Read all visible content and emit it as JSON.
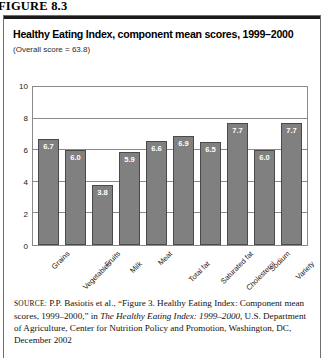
{
  "figure_label": "FIGURE 8.3",
  "chart_data": {
    "type": "bar",
    "title": "Healthy Eating Index, component mean scores, 1999–2000",
    "subtitle": "(Overall score = 63.8)",
    "xlabel": "",
    "ylabel": "",
    "ylim": [
      0,
      10
    ],
    "yticks": [
      10,
      8,
      6,
      4,
      2,
      0
    ],
    "grid": true,
    "legend": false,
    "bar_color": "#808080",
    "bar_edge_color": "#4a4a4a",
    "value_label_color": "#ffffff",
    "categories": [
      "Grains",
      "Vegetables",
      "Fruits",
      "Milk",
      "Meat",
      "Total fat",
      "Saturated fat",
      "Cholesterol",
      "Sodium",
      "Variety"
    ],
    "values": [
      6.7,
      6.0,
      3.8,
      5.9,
      6.6,
      6.9,
      6.5,
      7.7,
      6.0,
      7.7
    ],
    "value_labels": [
      "6.7",
      "6.0",
      "3.8",
      "5.9",
      "6.6",
      "6.9",
      "6.5",
      "7.7",
      "6.0",
      "7.7"
    ]
  },
  "source": {
    "kicker": "source:",
    "text_before_italic": " P.P. Basiotis et al., “Figure 3. Healthy Eating Index: Component mean scores, 1999–2000,” in ",
    "italic_title": "The Healthy Eating Index: 1999–2000,",
    "text_after_italic": " U.S. Department of Agriculture, Center for Nutrition Policy and Promotion, Washington, DC, December 2002"
  }
}
